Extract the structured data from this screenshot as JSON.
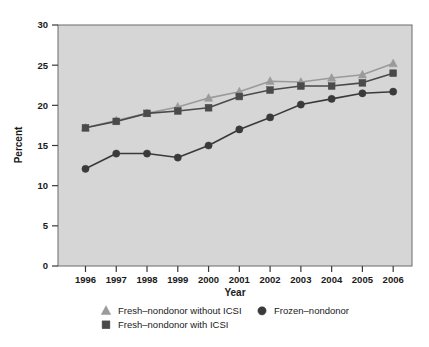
{
  "chart_data": {
    "type": "line",
    "title": "",
    "xlabel": "Year",
    "ylabel": "Percent",
    "categories": [
      "1996",
      "1997",
      "1998",
      "1999",
      "2000",
      "2001",
      "2002",
      "2003",
      "2004",
      "2005",
      "2006"
    ],
    "x": [
      1996,
      1997,
      1998,
      1999,
      2000,
      2001,
      2002,
      2003,
      2004,
      2005,
      2006
    ],
    "xlim": [
      1995.5,
      2006.5
    ],
    "ylim": [
      0,
      30
    ],
    "yticks": [
      0,
      5,
      10,
      15,
      20,
      25,
      30
    ],
    "ytick_labels": [
      "0",
      "5",
      "10",
      "15",
      "20",
      "25",
      "30"
    ],
    "grid": false,
    "legend_position": "below-plot",
    "series": [
      {
        "name": "Fresh–nondonor without ICSI",
        "marker": "triangle",
        "color": "#9a9a9a",
        "values": [
          17.2,
          18.1,
          19.0,
          19.8,
          20.9,
          21.7,
          23.0,
          22.9,
          23.4,
          23.8,
          25.2
        ]
      },
      {
        "name": "Fresh–nondonor with ICSI",
        "marker": "square",
        "color": "#4a4a4a",
        "values": [
          17.2,
          18.0,
          19.0,
          19.3,
          19.7,
          21.1,
          21.9,
          22.4,
          22.4,
          22.8,
          24.0
        ]
      },
      {
        "name": "Frozen–nondonor",
        "marker": "circle",
        "color": "#3a3a3a",
        "values": [
          12.1,
          14.0,
          14.0,
          13.5,
          15.0,
          17.0,
          18.5,
          20.1,
          20.8,
          21.5,
          21.7
        ]
      }
    ]
  },
  "axes": {
    "y_title": "Percent",
    "x_title": "Year",
    "y_ticks": [
      "30",
      "25",
      "20",
      "15",
      "10",
      "5",
      "0"
    ],
    "x_ticks": [
      "1996",
      "1997",
      "1998",
      "1999",
      "2000",
      "2001",
      "2002",
      "2003",
      "2004",
      "2005",
      "2006"
    ]
  },
  "legend": {
    "entries": [
      {
        "label": "Fresh–nondonor without ICSI",
        "marker": "triangle-marker",
        "color": "#9a9a9a"
      },
      {
        "label": "Fresh–nondonor with ICSI",
        "marker": "square-marker",
        "color": "#4a4a4a"
      },
      {
        "label": "Frozen–nondonor",
        "marker": "circle-marker",
        "color": "#3a3a3a"
      }
    ]
  },
  "colors": {
    "plot_background": "#d6d6d6",
    "page_background": "#ffffff",
    "frame": "#6a6a6a",
    "text": "#1a1a1a",
    "series_light": "#9a9a9a",
    "series_dark": "#4a4a4a",
    "series_darkest": "#3a3a3a"
  }
}
